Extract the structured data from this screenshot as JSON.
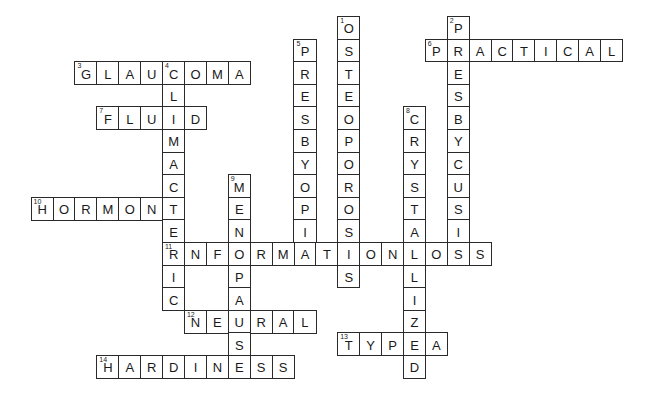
{
  "puzzle": {
    "type": "crossword",
    "grid": {
      "origin_x": 162,
      "origin_y": 16,
      "cell_width": 21.9,
      "cell_height": 22.6
    },
    "words": [
      {
        "number": 1,
        "direction": "down",
        "answer": "OSTEOPOROSIS",
        "row": 0,
        "col": 8
      },
      {
        "number": 2,
        "direction": "down",
        "answer": "PRESBYCUSIS",
        "row": 0,
        "col": 13
      },
      {
        "number": 3,
        "direction": "across",
        "answer": "GLAUCOMA",
        "row": 2,
        "col": -4
      },
      {
        "number": 4,
        "direction": "down",
        "answer": "CLIMACTERIC",
        "row": 2,
        "col": 0
      },
      {
        "number": 5,
        "direction": "down",
        "answer": "PRESBYOPIA",
        "row": 1,
        "col": 6
      },
      {
        "number": 6,
        "direction": "across",
        "answer": "PRACTICAL",
        "row": 1,
        "col": 12
      },
      {
        "number": 7,
        "direction": "across",
        "answer": "FLUID",
        "row": 4,
        "col": -3
      },
      {
        "number": 8,
        "direction": "down",
        "answer": "CRYSTALLIZED",
        "row": 4,
        "col": 11
      },
      {
        "number": 9,
        "direction": "down",
        "answer": "MENOPAUSE",
        "row": 7,
        "col": 3
      },
      {
        "number": 10,
        "direction": "across",
        "answer": "HORMONE",
        "row": 8,
        "col": -6
      },
      {
        "number": 11,
        "direction": "across",
        "answer": "INFORMATIONLOSS",
        "row": 10,
        "col": 0
      },
      {
        "number": 12,
        "direction": "across",
        "answer": "NEURAL",
        "row": 13,
        "col": 1
      },
      {
        "number": 13,
        "direction": "across",
        "answer": "TYPEA",
        "row": 14,
        "col": 8
      },
      {
        "number": 14,
        "direction": "across",
        "answer": "HARDINESS",
        "row": 15,
        "col": -3
      }
    ]
  }
}
